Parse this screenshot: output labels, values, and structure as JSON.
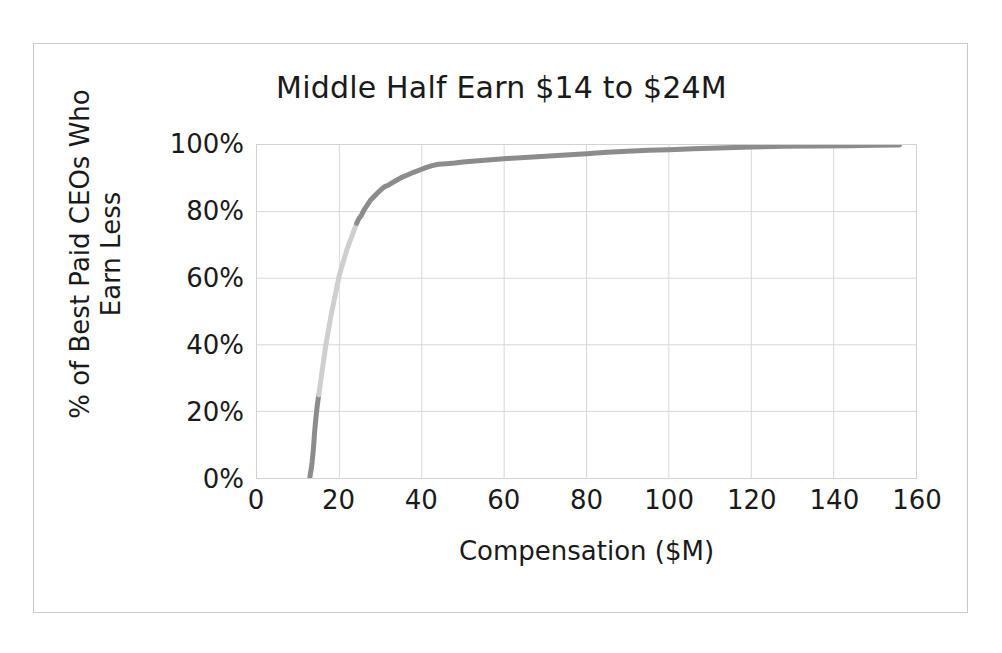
{
  "chart_data": {
    "type": "line",
    "title": "Middle Half Earn $14 to $24M",
    "xlabel": "Compensation ($M)",
    "ylabel_line1": "% of Best Paid CEOs Who",
    "ylabel_line2": "Earn Less",
    "ylabel": "% of Best Paid CEOs Who Earn Less",
    "xlim": [
      0,
      160
    ],
    "ylim": [
      0,
      100
    ],
    "xticks": [
      0,
      20,
      40,
      60,
      80,
      100,
      120,
      140,
      160
    ],
    "xtick_labels": [
      "0",
      "20",
      "40",
      "60",
      "80",
      "100",
      "120",
      "140",
      "160"
    ],
    "yticks": [
      0,
      20,
      40,
      60,
      80,
      100
    ],
    "ytick_labels": [
      "0%",
      "20%",
      "40%",
      "60%",
      "80%",
      "100%"
    ],
    "grid": true,
    "legend": "none",
    "colors": {
      "line_lower_quartile": "#8c8c8c",
      "line_middle_half": "#cfcfcf",
      "line_upper_quartile": "#8c8c8c",
      "gridline": "#d8d8d8",
      "plot_border": "#d2d2d2",
      "outer_border": "#c9c9c9",
      "text": "#1a1a1a",
      "background": "#ffffff"
    },
    "annotation_note": "Interquartile range of CEO compensation is $14M to $24M; curve is shaded light between the 25th and 75th percentiles.",
    "series": [
      {
        "name": "Cumulative distribution of CEO compensation",
        "x": [
          12.8,
          13.0,
          13.2,
          13.4,
          13.6,
          13.8,
          14.0,
          14.3,
          14.6,
          15.0,
          15.4,
          15.8,
          16.2,
          16.6,
          17.0,
          17.5,
          18.0,
          18.5,
          19.0,
          19.5,
          20.0,
          20.6,
          21.2,
          21.8,
          22.4,
          23.0,
          23.6,
          24.2,
          24.8,
          25.4,
          26.0,
          26.8,
          27.6,
          28.4,
          29.2,
          30.0,
          31.0,
          32.0,
          33.0,
          34.0,
          35.0,
          36.5,
          38.0,
          39.5,
          41.0,
          42.5,
          44.0,
          46.0,
          48.0,
          50.0,
          53.0,
          56.0,
          60.0,
          64.0,
          68.0,
          72.0,
          76.0,
          80.0,
          85.0,
          90.0,
          95.0,
          100.0,
          106.0,
          112.0,
          120.0,
          128.0,
          136.0,
          144.0,
          150.0,
          156.0
        ],
        "y": [
          0.0,
          1.5,
          3.0,
          5.0,
          7.5,
          10.5,
          14.0,
          18.0,
          21.5,
          25.0,
          28.5,
          32.0,
          35.5,
          39.0,
          42.0,
          45.5,
          49.0,
          52.0,
          55.0,
          58.0,
          61.0,
          63.5,
          66.0,
          68.5,
          70.5,
          72.5,
          74.5,
          76.5,
          78.0,
          79.0,
          80.5,
          82.0,
          83.5,
          84.5,
          85.5,
          86.5,
          87.5,
          88.0,
          88.8,
          89.5,
          90.2,
          91.0,
          91.8,
          92.5,
          93.2,
          93.8,
          94.2,
          94.4,
          94.6,
          94.9,
          95.2,
          95.5,
          95.9,
          96.2,
          96.5,
          96.8,
          97.1,
          97.4,
          97.8,
          98.1,
          98.4,
          98.6,
          98.9,
          99.1,
          99.4,
          99.6,
          99.7,
          99.8,
          99.9,
          100.0
        ],
        "quartile_breaks": {
          "p25_x": 14.0,
          "p25_y": 25.0,
          "p75_x": 24.2,
          "p75_y": 76.5
        }
      }
    ]
  }
}
